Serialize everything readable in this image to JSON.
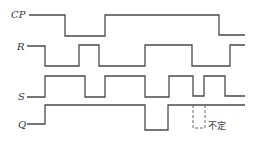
{
  "diagram": {
    "type": "timing-diagram",
    "signals": [
      {
        "label": "CP",
        "label_pos": [
          11,
          18
        ],
        "lead": [
          29,
          15,
          34,
          15
        ],
        "points": "29,15 65,15 65,36 105,36 105,15 219,15 219,35 245,35"
      },
      {
        "label": "R",
        "label_pos": [
          17,
          50
        ],
        "lead": [
          27,
          46,
          33,
          46
        ],
        "points": "27,46 45,46 45,66 79,66 79,45 99,45 99,66 145,66 145,45 192,45 192,66 230,66 230,45 245,45"
      },
      {
        "label": "S",
        "label_pos": [
          18,
          100
        ],
        "lead": [
          27,
          97,
          33,
          97
        ],
        "points": "27,97 45,97 45,76 85,76 85,97 105,97 105,76 145,76 145,97 169,97 169,76 193,76 193,96 204,96 204,76 225,76 225,96 245,96"
      },
      {
        "label": "Q",
        "label_pos": [
          18,
          128
        ],
        "lead": [
          27,
          124,
          33,
          124
        ],
        "points": "27,124 45,124 45,105 145,105 145,130 168,130 168,105 245,105"
      }
    ],
    "undefined_region": {
      "x": 193,
      "y": 105,
      "width": 12,
      "height": 23,
      "label": "不定",
      "label_pos": [
        208,
        129
      ]
    },
    "colors": {
      "line": "#4a4a4a",
      "text": "#333333",
      "background": "#ffffff"
    }
  }
}
